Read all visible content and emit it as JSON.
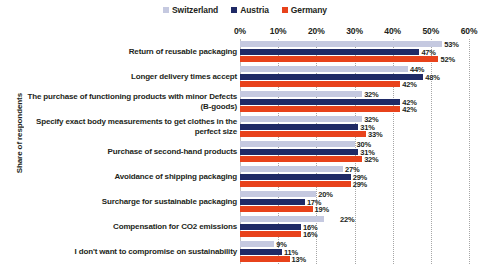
{
  "chart_data": {
    "type": "bar",
    "orientation": "horizontal",
    "title": "",
    "xlabel": "",
    "ylabel": "Share of respondents",
    "xlim": [
      0,
      60
    ],
    "xticks": [
      "0%",
      "10%",
      "20%",
      "30%",
      "40%",
      "50%",
      "60%"
    ],
    "xtick_values": [
      0,
      10,
      20,
      30,
      40,
      50,
      60
    ],
    "grid": "vertical-dotted",
    "legend_position": "top-center",
    "value_suffix": "%",
    "categories": [
      "Return of reusable packaging",
      "Longer delivery times accept",
      "The purchase of functioning products with minor Defects (B-goods)",
      "Specify exact body measurements to get clothes in the perfect size",
      "Purchase of second-hand products",
      "Avoidance of shipping packaging",
      "Surcharge for sustainable packaging",
      "Compensation for CO2 emissions",
      "I don't want to compromise on sustainability"
    ],
    "series": [
      {
        "name": "Switzerland",
        "color": "#c5c9e0",
        "values": [
          53,
          44,
          32,
          32,
          30,
          27,
          20,
          22,
          9
        ],
        "labels": [
          "53%",
          "44%",
          "32%",
          "32%",
          "30%",
          "27%",
          "20%",
          "22%",
          "9%"
        ]
      },
      {
        "name": "Austria",
        "color": "#1f2a66",
        "values": [
          47,
          48,
          42,
          31,
          31,
          29,
          17,
          16,
          11
        ],
        "labels": [
          "47%",
          "48%",
          "42%",
          "31%",
          "31%",
          "29%",
          "17%",
          "16%",
          "11%"
        ]
      },
      {
        "name": "Germany",
        "color": "#e8421b",
        "values": [
          52,
          42,
          42,
          33,
          32,
          29,
          19,
          16,
          13
        ],
        "labels": [
          "52%",
          "42%",
          "42%",
          "33%",
          "32%",
          "29%",
          "19%",
          "16%",
          "13%"
        ]
      }
    ]
  }
}
